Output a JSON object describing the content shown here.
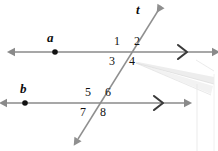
{
  "figure": {
    "background_color": "#ffffff",
    "line_color": "#8a8a8a",
    "label_color": "#111111",
    "watermark_color": "#e2e2e2",
    "width": 218,
    "height": 151
  },
  "lines": [
    {
      "id": "line-a",
      "label": "a",
      "label_x": 47,
      "label_y": 31,
      "kind": "horizontal-parallel-line",
      "y": 52,
      "x_start": 12,
      "x_end": 214,
      "point_x": 55,
      "point_y": 52,
      "arrow_left": true,
      "arrow_right": true,
      "parallel_mark": ">",
      "parallel_mark_x": 182,
      "parallel_mark_y": 52
    },
    {
      "id": "line-b",
      "label": "b",
      "label_x": 20,
      "label_y": 82,
      "kind": "horizontal-parallel-line",
      "y": 103,
      "x_start": 4,
      "x_end": 186,
      "point_x": 25,
      "point_y": 103,
      "arrow_left": true,
      "arrow_right": true,
      "parallel_mark": ">",
      "parallel_mark_x": 158,
      "parallel_mark_y": 103
    },
    {
      "id": "line-t",
      "label": "t",
      "label_x": 136,
      "label_y": 3,
      "kind": "transversal",
      "x_top": 163,
      "y_top": 4,
      "x_bottom": 76,
      "y_bottom": 142,
      "arrow_top": true,
      "arrow_bottom": true
    }
  ],
  "intersections": [
    {
      "id": "intersection-a-t",
      "x": 127,
      "y": 52
    },
    {
      "id": "intersection-b-t",
      "x": 98,
      "y": 103
    }
  ],
  "angles": [
    {
      "id": "angle-1",
      "label": "1",
      "x": 114,
      "y": 35,
      "position": "upper-left-at-a"
    },
    {
      "id": "angle-2",
      "label": "2",
      "x": 134,
      "y": 35,
      "position": "upper-right-at-a"
    },
    {
      "id": "angle-3",
      "label": "3",
      "x": 109,
      "y": 55,
      "position": "lower-left-at-a"
    },
    {
      "id": "angle-4",
      "label": "4",
      "x": 129,
      "y": 55,
      "position": "lower-right-at-a"
    },
    {
      "id": "angle-5",
      "label": "5",
      "x": 85,
      "y": 86,
      "position": "upper-left-at-b"
    },
    {
      "id": "angle-6",
      "label": "6",
      "x": 105,
      "y": 86,
      "position": "upper-right-at-b"
    },
    {
      "id": "angle-7",
      "label": "7",
      "x": 80,
      "y": 106,
      "position": "lower-left-at-b"
    },
    {
      "id": "angle-8",
      "label": "8",
      "x": 100,
      "y": 106,
      "position": "lower-right-at-b"
    }
  ],
  "watermark": {
    "id": "scan-artifact",
    "description": "faint light gray banner shape in lower right"
  }
}
